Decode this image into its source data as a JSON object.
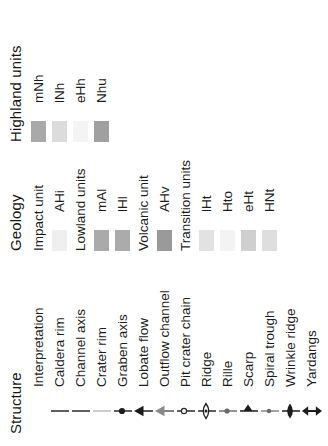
{
  "legend": {
    "sections": [
      {
        "id": "structure",
        "title": "Structure",
        "subhead": "Interpretation",
        "items": [
          {
            "label": "Caldera rim",
            "symbol": "line-plain-dark"
          },
          {
            "label": "Channel axis",
            "symbol": "line-plain-dark"
          },
          {
            "label": "Crater rim",
            "symbol": "line-plain-light"
          },
          {
            "label": "Graben axis",
            "symbol": "line-dot-dark"
          },
          {
            "label": "Lobate flow",
            "symbol": "line-arrow-black"
          },
          {
            "label": "Outflow channel",
            "symbol": "line-arrow-gray"
          },
          {
            "label": "Pit crater chain",
            "symbol": "line-circle-open"
          },
          {
            "label": "Ridge",
            "symbol": "line-lens-open"
          },
          {
            "label": "Rille",
            "symbol": "line-dot-gray"
          },
          {
            "label": "Scarp",
            "symbol": "line-halfarrow"
          },
          {
            "label": "Spiral trough",
            "symbol": "line-dot-gray-small"
          },
          {
            "label": "Wrinkle ridge",
            "symbol": "line-lens-filled"
          },
          {
            "label": "Yardangs",
            "symbol": "line-double-arrow"
          }
        ]
      },
      {
        "id": "geology",
        "title": "Geology",
        "groups": [
          {
            "group_label": "Impact unit",
            "units": [
              {
                "code": "AHi",
                "color": "#efefef"
              }
            ]
          },
          {
            "group_label": "Lowland units",
            "units": [
              {
                "code": "mAl",
                "color": "#aaaaaa"
              },
              {
                "code": "lHl",
                "color": "#ababab"
              }
            ]
          },
          {
            "group_label": "Volcanic unit",
            "units": [
              {
                "code": "AHv",
                "color": "#9a9a9a"
              }
            ]
          },
          {
            "group_label": "Transition units",
            "units": [
              {
                "code": "lHt",
                "color": "#e2e2e2"
              },
              {
                "code": "Hto",
                "color": "#f3f3f3"
              },
              {
                "code": "eHt",
                "color": "#cfcfcf"
              },
              {
                "code": "HNt",
                "color": "#dedede"
              }
            ]
          }
        ]
      },
      {
        "id": "highland",
        "title": "Highland units",
        "groups": [
          {
            "group_label": "",
            "units": [
              {
                "code": "mNh",
                "color": "#a9a9a9"
              },
              {
                "code": "lNh",
                "color": "#dcdcdc"
              },
              {
                "code": "eHh",
                "color": "#f4f4f4"
              },
              {
                "code": "Nhu",
                "color": "#a0a0a0"
              }
            ]
          }
        ]
      }
    ]
  },
  "colors": {
    "ink": "#1a1a1a",
    "line_dark": "#2a2a2a",
    "line_light": "#bdbdbd",
    "gray_symbol": "#7d7d7d"
  }
}
